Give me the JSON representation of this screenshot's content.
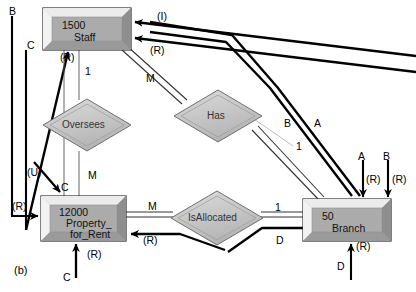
{
  "figure": {
    "caption": "(b)",
    "type": "entity-relationship-diagram"
  },
  "entities": [
    {
      "id": "staff",
      "count": "1500",
      "name": "Staff",
      "x": 43,
      "y": 8,
      "w": 88,
      "h": 42
    },
    {
      "id": "property_for_rent",
      "count": "12000",
      "name_line1": "Property_",
      "name_line2": "for_Rent",
      "x": 41,
      "y": 196,
      "w": 85,
      "h": 45
    },
    {
      "id": "branch",
      "count": "50",
      "name": "Branch",
      "x": 303,
      "y": 199,
      "w": 88,
      "h": 42
    }
  ],
  "relationships": [
    {
      "id": "oversees",
      "label": "Oversees",
      "cx": 87,
      "cy": 125,
      "rx": 44,
      "ry": 26
    },
    {
      "id": "has",
      "label": "Has",
      "cx": 218,
      "cy": 116,
      "rx": 44,
      "ry": 26
    },
    {
      "id": "isallocated",
      "label": "IsAllocated",
      "cx": 217,
      "cy": 218,
      "rx": 46,
      "ry": 27
    }
  ],
  "cardinality_labels": [
    {
      "text": "1",
      "x": 85,
      "y": 66
    },
    {
      "text": "M",
      "x": 88,
      "y": 170
    },
    {
      "text": "M",
      "x": 146,
      "y": 73
    },
    {
      "text": "1",
      "x": 296,
      "y": 141
    },
    {
      "text": "M",
      "x": 148,
      "y": 201
    },
    {
      "text": "1",
      "x": 275,
      "y": 202
    }
  ],
  "operation_labels": [
    {
      "text": "B",
      "x": 9,
      "y": 6
    },
    {
      "text": "C",
      "x": 27,
      "y": 40
    },
    {
      "text": "(I)",
      "x": 157,
      "y": 11
    },
    {
      "text": "(R)",
      "x": 150,
      "y": 45
    },
    {
      "text": "(R)",
      "x": 60,
      "y": 52
    },
    {
      "text": "B",
      "x": 284,
      "y": 118
    },
    {
      "text": "A",
      "x": 314,
      "y": 118
    },
    {
      "text": "(U)",
      "x": 27,
      "y": 167
    },
    {
      "text": "C",
      "x": 61,
      "y": 182
    },
    {
      "text": "A",
      "x": 358,
      "y": 151
    },
    {
      "text": "B",
      "x": 383,
      "y": 151
    },
    {
      "text": "(R)",
      "x": 366,
      "y": 174
    },
    {
      "text": "(R)",
      "x": 392,
      "y": 174
    },
    {
      "text": "(R)",
      "x": 12,
      "y": 201
    },
    {
      "text": "(R)",
      "x": 143,
      "y": 235
    },
    {
      "text": "D",
      "x": 276,
      "y": 235
    },
    {
      "text": "(R)",
      "x": 87,
      "y": 249
    },
    {
      "text": "C",
      "x": 63,
      "y": 272
    },
    {
      "text": "(R)",
      "x": 356,
      "y": 241
    },
    {
      "text": "D",
      "x": 337,
      "y": 261
    }
  ],
  "colors": {
    "entity_fill": "#a9a9a9",
    "entity_highlight": "#e8e8e8",
    "entity_shadow": "#8a8a8a",
    "relationship_fill": "#c9c9c9",
    "line": "#000000",
    "thin_line": "#555555",
    "background": "#ffffff"
  }
}
